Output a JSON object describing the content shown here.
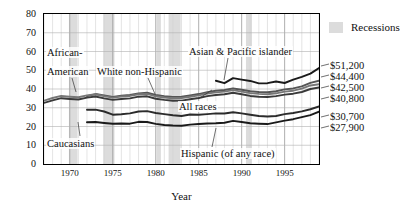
{
  "axes": {
    "ylabel": "Income (thousands of dollars)",
    "xlabel": "Year",
    "yticks": [
      "0",
      "10",
      "20",
      "30",
      "40",
      "50",
      "60",
      "70",
      "80"
    ],
    "xticks": [
      "1970",
      "1975",
      "1980",
      "1985",
      "1990",
      "1995"
    ]
  },
  "legend": {
    "recessions_label": "Recessions",
    "recession_color": "#dcdcdc"
  },
  "annotations": {
    "african_american": "African-\nAmerican",
    "african_american_l1": "African-",
    "african_american_l2": "American",
    "white_non_hispanic": "White non-Hispanic",
    "asian_pacific": "Asian & Pacific islander",
    "all_races": "All races",
    "caucasians": "Caucasians",
    "hispanic": "Hispanic (of any race)"
  },
  "end_values": [
    {
      "label": "$51,200",
      "series": "Asian & Pacific islander"
    },
    {
      "label": "$44,400",
      "series": "White non-Hispanic"
    },
    {
      "label": "$42,500",
      "series": "Caucasians"
    },
    {
      "label": "$40,800",
      "series": "All races"
    },
    {
      "label": "$30,700",
      "series": "Hispanic (of any race)"
    },
    {
      "label": "$27,900",
      "series": "African-American"
    }
  ],
  "chart_data": {
    "type": "line",
    "title": "",
    "xlabel": "Year",
    "ylabel": "Income (thousands of dollars)",
    "xlim": [
      1967,
      1999
    ],
    "ylim": [
      0,
      80
    ],
    "grid": true,
    "legend_position": "right",
    "x": [
      1967,
      1968,
      1969,
      1970,
      1971,
      1972,
      1973,
      1974,
      1975,
      1976,
      1977,
      1978,
      1979,
      1980,
      1981,
      1982,
      1983,
      1984,
      1985,
      1986,
      1987,
      1988,
      1989,
      1990,
      1991,
      1992,
      1993,
      1994,
      1995,
      1996,
      1997,
      1998,
      1999
    ],
    "series": [
      {
        "name": "Asian & Pacific islander",
        "color": "#1a1a1a",
        "start_year": 1987,
        "values": [
          null,
          null,
          null,
          null,
          null,
          null,
          null,
          null,
          null,
          null,
          null,
          null,
          null,
          null,
          null,
          null,
          null,
          null,
          null,
          null,
          44.4,
          43.1,
          45.8,
          45.0,
          44.3,
          43.0,
          43.1,
          44.0,
          43.2,
          45.0,
          46.5,
          48.2,
          51.2
        ]
      },
      {
        "name": "White non-Hispanic",
        "color": "#555555",
        "start_year": 1972,
        "values": [
          null,
          null,
          null,
          null,
          null,
          36.2,
          37.3,
          36.5,
          35.8,
          36.4,
          36.8,
          37.6,
          38.0,
          36.8,
          36.2,
          35.8,
          35.9,
          36.6,
          37.3,
          38.3,
          39.1,
          39.5,
          40.3,
          39.6,
          38.8,
          38.4,
          38.3,
          38.8,
          39.8,
          40.3,
          41.4,
          43.3,
          44.4
        ]
      },
      {
        "name": "Caucasians",
        "color": "#777777",
        "start_year": 1967,
        "values": [
          33.8,
          35.2,
          36.3,
          35.9,
          35.6,
          36.6,
          37.2,
          36.2,
          35.4,
          36.0,
          36.3,
          37.2,
          37.4,
          36.1,
          35.5,
          35.1,
          35.2,
          35.9,
          36.6,
          37.6,
          38.2,
          38.6,
          39.4,
          38.6,
          37.8,
          37.4,
          37.2,
          37.7,
          38.6,
          39.1,
          40.2,
          41.9,
          42.5
        ]
      },
      {
        "name": "All races",
        "color": "#3a3a3a",
        "start_year": 1967,
        "values": [
          32.6,
          33.9,
          35.1,
          34.7,
          34.4,
          35.4,
          36.0,
          35.0,
          34.2,
          34.7,
          35.0,
          35.9,
          36.1,
          34.8,
          34.2,
          33.7,
          33.8,
          34.5,
          35.2,
          36.2,
          36.8,
          37.2,
          38.0,
          37.2,
          36.3,
          35.9,
          35.7,
          36.2,
          37.0,
          37.5,
          38.4,
          40.0,
          40.8
        ]
      },
      {
        "name": "African-American",
        "color": "#1a1a1a",
        "start_year": 1972,
        "values": [
          null,
          null,
          null,
          null,
          null,
          22.3,
          22.4,
          21.9,
          21.5,
          21.6,
          21.5,
          22.5,
          22.4,
          21.4,
          20.8,
          20.5,
          20.4,
          21.0,
          21.3,
          21.6,
          21.7,
          22.0,
          23.0,
          22.4,
          21.7,
          21.5,
          21.3,
          22.2,
          23.1,
          23.9,
          25.0,
          26.1,
          27.9
        ]
      },
      {
        "name": "Hispanic (of any race)",
        "color": "#2b2b2b",
        "start_year": 1972,
        "values": [
          null,
          null,
          null,
          null,
          null,
          28.9,
          29.0,
          28.0,
          26.3,
          26.5,
          27.0,
          28.0,
          28.2,
          27.2,
          26.6,
          26.0,
          25.6,
          26.4,
          26.3,
          26.6,
          27.0,
          26.9,
          27.6,
          27.0,
          26.3,
          25.6,
          25.3,
          25.6,
          26.6,
          27.2,
          28.1,
          29.2,
          30.7
        ]
      }
    ],
    "recessions": [
      {
        "start": 1969.9,
        "end": 1970.9
      },
      {
        "start": 1973.9,
        "end": 1975.2
      },
      {
        "start": 1980.1,
        "end": 1980.6
      },
      {
        "start": 1981.5,
        "end": 1982.9
      },
      {
        "start": 1990.5,
        "end": 1991.2
      }
    ]
  }
}
